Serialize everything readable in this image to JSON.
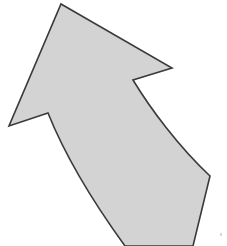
{
  "canvas": {
    "width": 227,
    "height": 246,
    "background_color": "#ffffff",
    "title": "Curved Arrow Shape"
  },
  "shape": {
    "name": "curved-bent-arrow",
    "description": "Light gray curved arrow with outline pointing toward the upper left",
    "fill_color": "#d3d3d3",
    "stroke_color": "#3a3a3a",
    "stroke_width": 1.6,
    "direction": "upper-left",
    "path": "M 61 4 L 172 68 L 133 80 C 150 108 178 146 210 176 L 193 246 L 125 246 C 96 206 66 158 48 113 L 9 126 Z",
    "vertices": [
      {
        "name": "arrow-tip-apex",
        "x": 61,
        "y": 4
      },
      {
        "name": "right-barb-tip",
        "x": 172,
        "y": 68
      },
      {
        "name": "right-inner-notch",
        "x": 133,
        "y": 80
      },
      {
        "name": "right-shaft-corner",
        "x": 210,
        "y": 176
      },
      {
        "name": "bottom-right-exit",
        "x": 193,
        "y": 246
      },
      {
        "name": "bottom-left-exit",
        "x": 125,
        "y": 246
      },
      {
        "name": "left-inner-notch",
        "x": 48,
        "y": 113
      },
      {
        "name": "left-barb-tip",
        "x": 9,
        "y": 126
      }
    ],
    "curves": [
      {
        "name": "right-concave-edge",
        "type": "concave",
        "from": "right-inner-notch",
        "to": "right-shaft-corner",
        "control": [
          150,
          108,
          178,
          146
        ]
      },
      {
        "name": "left-convex-edge",
        "type": "convex",
        "from": "bottom-left-exit",
        "to": "left-inner-notch",
        "control": [
          96,
          206,
          66,
          158
        ]
      }
    ]
  },
  "artifacts": [
    {
      "name": "speck-mark",
      "x": 220,
      "y": 233,
      "color": "#c9c9c9"
    }
  ]
}
